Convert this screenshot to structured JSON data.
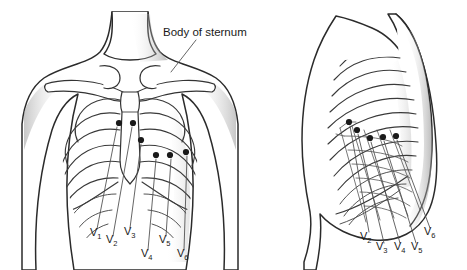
{
  "figure": {
    "title_annotation": "Body of sternum",
    "background_color": "#ffffff",
    "ink_color": "#2b2b2b",
    "electrode_color": "#1a1a1a"
  },
  "panels": [
    {
      "id": "anterior",
      "name": "anterior-chest-view",
      "view_label": "Anterior chest wall",
      "annotations": [
        {
          "id": "body-of-sternum",
          "text": "Body of sternum",
          "text_x": 163,
          "text_y": 36,
          "leader": "M 196 40 L 171 72"
        }
      ],
      "electrodes": [
        {
          "id": "V1",
          "label": "V",
          "sub": "1",
          "cx": 119,
          "cy": 123,
          "label_x": 90,
          "label_y": 236,
          "leader": "M 117 127 L 97 229"
        },
        {
          "id": "V2",
          "label": "V",
          "sub": "2",
          "cx": 133,
          "cy": 123,
          "label_x": 106,
          "label_y": 243,
          "leader": "M 132 127 L 113 236"
        },
        {
          "id": "V3",
          "label": "V",
          "sub": "3",
          "cx": 141,
          "cy": 140,
          "label_x": 124,
          "label_y": 235,
          "leader": "M 141 144 L 130 228"
        },
        {
          "id": "V4",
          "label": "V",
          "sub": "4",
          "cx": 156,
          "cy": 155,
          "label_x": 141,
          "label_y": 257,
          "leader": "M 156 159 L 148 250"
        },
        {
          "id": "V5",
          "label": "V",
          "sub": "5",
          "cx": 170,
          "cy": 155,
          "label_x": 159,
          "label_y": 243,
          "leader": "M 171 159 L 166 236"
        },
        {
          "id": "V6",
          "label": "V",
          "sub": "6",
          "cx": 186,
          "cy": 152,
          "label_x": 177,
          "label_y": 257,
          "leader": "M 187 156 L 184 250"
        }
      ]
    },
    {
      "id": "lateral",
      "name": "left-lateral-chest-view",
      "view_label": "Left lateral chest wall",
      "annotations": [],
      "electrodes": [
        {
          "id": "V2",
          "label": "V",
          "sub": "2",
          "cx": 349,
          "cy": 122,
          "label_x": 360,
          "label_y": 240,
          "leader": "M 350 126 L 369 232"
        },
        {
          "id": "V3",
          "label": "V",
          "sub": "3",
          "cx": 357,
          "cy": 130,
          "label_x": 376,
          "label_y": 250,
          "leader": "M 358 134 L 384 243"
        },
        {
          "id": "V4",
          "label": "V",
          "sub": "4",
          "cx": 370,
          "cy": 138,
          "label_x": 394,
          "label_y": 250,
          "leader": "M 371 142 L 400 243"
        },
        {
          "id": "V5",
          "label": "V",
          "sub": "5",
          "cx": 383,
          "cy": 137,
          "label_x": 411,
          "label_y": 250,
          "leader": "M 384 141 L 416 243"
        },
        {
          "id": "V6",
          "label": "V",
          "sub": "6",
          "cx": 396,
          "cy": 136,
          "label_x": 424,
          "label_y": 235,
          "leader": "M 397 140 L 430 228"
        }
      ]
    }
  ]
}
